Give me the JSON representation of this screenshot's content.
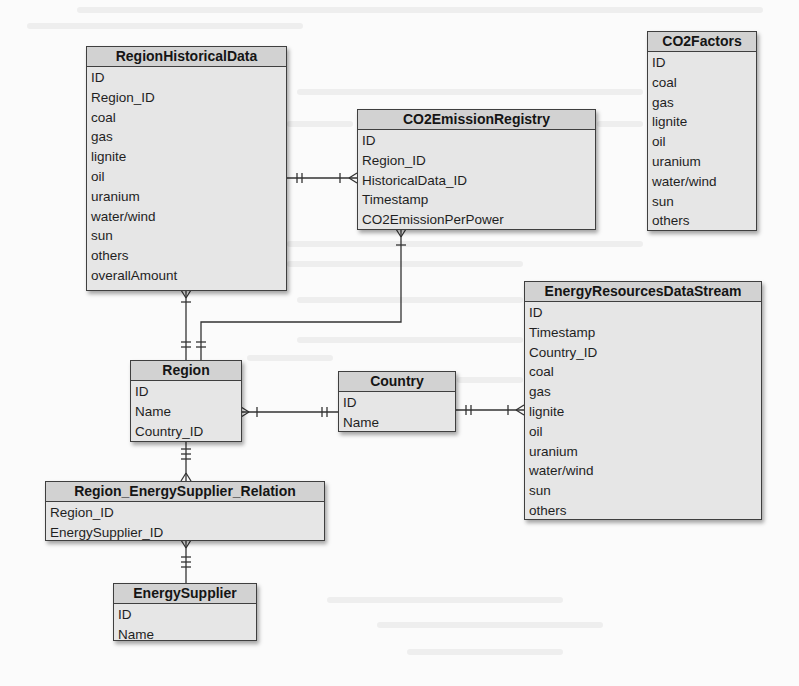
{
  "diagram": {
    "type": "entity-relationship",
    "entities": [
      {
        "key": "region_historical_data",
        "name": "RegionHistoricalData",
        "attributes": [
          "ID",
          "Region_ID",
          "coal",
          "gas",
          "lignite",
          "oil",
          "uranium",
          "water/wind",
          "sun",
          "others",
          "overallAmount"
        ]
      },
      {
        "key": "co2_emission_registry",
        "name": "CO2EmissionRegistry",
        "attributes": [
          "ID",
          "Region_ID",
          "HistoricalData_ID",
          "Timestamp",
          "CO2EmissionPerPower"
        ]
      },
      {
        "key": "co2_factors",
        "name": "CO2Factors",
        "attributes": [
          "ID",
          "coal",
          "gas",
          "lignite",
          "oil",
          "uranium",
          "water/wind",
          "sun",
          "others"
        ]
      },
      {
        "key": "energy_resources_data_stream",
        "name": "EnergyResourcesDataStream",
        "attributes": [
          "ID",
          "Timestamp",
          "Country_ID",
          "coal",
          "gas",
          "lignite",
          "oil",
          "uranium",
          "water/wind",
          "sun",
          "others"
        ]
      },
      {
        "key": "region",
        "name": "Region",
        "attributes": [
          "ID",
          "Name",
          "Country_ID"
        ]
      },
      {
        "key": "country",
        "name": "Country",
        "attributes": [
          "ID",
          "Name"
        ]
      },
      {
        "key": "region_energy_supplier_relation",
        "name": "Region_EnergySupplier_Relation",
        "attributes": [
          "Region_ID",
          "EnergySupplier_ID"
        ]
      },
      {
        "key": "energy_supplier",
        "name": "EnergySupplier",
        "attributes": [
          "ID",
          "Name"
        ]
      }
    ],
    "relationships": [
      {
        "from": "Region",
        "to": "RegionHistoricalData",
        "from_card": "one-and-only-one",
        "to_card": "one-or-many"
      },
      {
        "from": "RegionHistoricalData",
        "to": "CO2EmissionRegistry",
        "from_card": "one-and-only-one",
        "to_card": "one-or-many"
      },
      {
        "from": "Region",
        "to": "CO2EmissionRegistry",
        "from_card": "one-and-only-one",
        "to_card": "one-or-many"
      },
      {
        "from": "Country",
        "to": "Region",
        "from_card": "one-and-only-one",
        "to_card": "one-or-many"
      },
      {
        "from": "Country",
        "to": "EnergyResourcesDataStream",
        "from_card": "one-and-only-one",
        "to_card": "one-or-many"
      },
      {
        "from": "Region",
        "to": "Region_EnergySupplier_Relation",
        "from_card": "one-and-only-one",
        "to_card": "one-or-many"
      },
      {
        "from": "EnergySupplier",
        "to": "Region_EnergySupplier_Relation",
        "from_card": "one-and-only-one",
        "to_card": "one-or-many"
      }
    ]
  },
  "colors": {
    "entity_body": "#e6e6e6",
    "entity_header": "#d2d2d2",
    "entity_border": "#3f3f3f",
    "connector": "#333333",
    "page_background": "#fbfbfb"
  }
}
